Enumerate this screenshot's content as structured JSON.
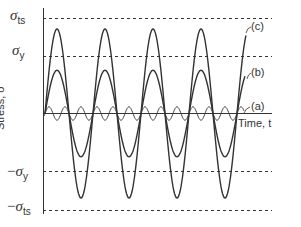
{
  "figure": {
    "y_axis_label": "Stress, σ",
    "x_axis_label": "Time, t",
    "levels": [
      {
        "id": "sigma_ts",
        "symbol": "σ",
        "sub": "ts",
        "prefix": ""
      },
      {
        "id": "sigma_y",
        "symbol": "σ",
        "sub": "y",
        "prefix": ""
      },
      {
        "id": "neg_sigma_y",
        "symbol": "σ",
        "sub": "y",
        "prefix": "−"
      },
      {
        "id": "neg_sigma_ts",
        "symbol": "σ",
        "sub": "ts",
        "prefix": "−"
      }
    ],
    "curve_labels": {
      "a": "(a)",
      "b": "(b)",
      "c": "(c)"
    }
  },
  "chart_data": {
    "type": "line",
    "title": "",
    "xlabel": "Time, t",
    "ylabel": "Stress, σ",
    "grid": false,
    "reference_lines": [
      {
        "label": "σts",
        "value": 1.0,
        "style": "dashed"
      },
      {
        "label": "σy",
        "value": 0.6,
        "style": "dashed"
      },
      {
        "label": "−σy",
        "value": -0.6,
        "style": "dashed"
      },
      {
        "label": "−σts",
        "value": -1.0,
        "style": "dashed"
      }
    ],
    "series": [
      {
        "name": "(a)",
        "shape": "sine",
        "amplitude": 0.07,
        "cycles": 12.5,
        "description": "small-amplitude stress, well below yield"
      },
      {
        "name": "(b)",
        "shape": "sine",
        "amplitude": 0.45,
        "cycles": 4.2,
        "description": "amplitude below yield strength"
      },
      {
        "name": "(c)",
        "shape": "sine",
        "amplitude": 0.88,
        "cycles": 4.2,
        "description": "amplitude exceeds yield, below tensile strength"
      }
    ],
    "ylim": [
      -1.05,
      1.1
    ]
  }
}
